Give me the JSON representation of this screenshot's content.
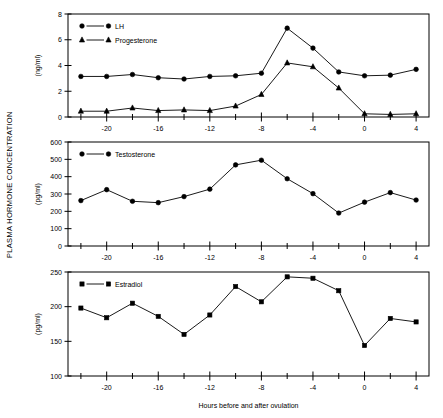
{
  "figure": {
    "y_axis_main_label": "PLASMA HORMONE CONCENTRATION",
    "x_axis_label": "Hours before and after ovulation"
  },
  "chart_data": [
    {
      "type": "line",
      "panel": "top",
      "title": "",
      "xlabel": "",
      "ylabel": "(ng/ml)",
      "xlim": [
        -23,
        5
      ],
      "ylim": [
        0,
        8
      ],
      "xticks": [
        -20,
        -16,
        -12,
        -8,
        -4,
        0,
        4
      ],
      "xticklabels": [
        "-20",
        "-16",
        "-12",
        "-8",
        "-4",
        "0",
        "4"
      ],
      "yticks": [
        0,
        2,
        4,
        6,
        8
      ],
      "yticklabels": [
        "0",
        "2",
        "4",
        "6",
        "8"
      ],
      "grid": false,
      "legend_position": "upper-left",
      "x": [
        -22,
        -20,
        -18,
        -16,
        -14,
        -12,
        -10,
        -8,
        -6,
        -4,
        -2,
        0,
        2,
        4
      ],
      "series": [
        {
          "name": "LH",
          "marker": "circle",
          "values": [
            3.15,
            3.15,
            3.3,
            3.05,
            2.95,
            3.15,
            3.2,
            3.4,
            6.9,
            5.35,
            3.5,
            3.2,
            3.25,
            3.7
          ]
        },
        {
          "name": "Progesterone",
          "marker": "triangle",
          "values": [
            0.45,
            0.45,
            0.7,
            0.5,
            0.55,
            0.5,
            0.85,
            1.75,
            4.2,
            3.9,
            2.25,
            0.25,
            0.2,
            0.25
          ]
        }
      ]
    },
    {
      "type": "line",
      "panel": "middle",
      "title": "",
      "xlabel": "",
      "ylabel": "(pg/ml)",
      "xlim": [
        -23,
        5
      ],
      "ylim": [
        0,
        600
      ],
      "xticks": [
        -20,
        -16,
        -12,
        -8,
        -4,
        0,
        4
      ],
      "xticklabels": [
        "-20",
        "-16",
        "-12",
        "-8",
        "-4",
        "0",
        "4"
      ],
      "yticks": [
        0,
        100,
        200,
        300,
        400,
        500,
        600
      ],
      "yticklabels": [
        "0",
        "100",
        "200",
        "300",
        "400",
        "500",
        "600"
      ],
      "grid": false,
      "legend_position": "upper-left",
      "x": [
        -22,
        -20,
        -18,
        -16,
        -14,
        -12,
        -10,
        -8,
        -6,
        -4,
        -2,
        0,
        2,
        4
      ],
      "series": [
        {
          "name": "Testosterone",
          "marker": "circle",
          "values": [
            262,
            325,
            258,
            250,
            285,
            328,
            468,
            495,
            388,
            302,
            190,
            253,
            308,
            265
          ]
        }
      ]
    },
    {
      "type": "line",
      "panel": "bottom",
      "title": "",
      "xlabel": "Hours before and after ovulation",
      "ylabel": "(pg/ml)",
      "xlim": [
        -23,
        5
      ],
      "ylim": [
        100,
        250
      ],
      "xticks": [
        -20,
        -16,
        -12,
        -8,
        -4,
        0,
        4
      ],
      "xticklabels": [
        "-20",
        "-16",
        "-12",
        "-8",
        "-4",
        "0",
        "4"
      ],
      "yticks": [
        100,
        150,
        200,
        250
      ],
      "yticklabels": [
        "100",
        "150",
        "200",
        "250"
      ],
      "grid": false,
      "legend_position": "upper-left",
      "x": [
        -22,
        -20,
        -18,
        -16,
        -14,
        -12,
        -10,
        -8,
        -6,
        -4,
        -2,
        0,
        2,
        4
      ],
      "series": [
        {
          "name": "Estradiol",
          "marker": "square",
          "values": [
            198,
            184,
            205,
            186,
            160,
            188,
            229,
            207,
            243,
            241,
            223,
            144,
            183,
            178
          ]
        }
      ]
    }
  ]
}
